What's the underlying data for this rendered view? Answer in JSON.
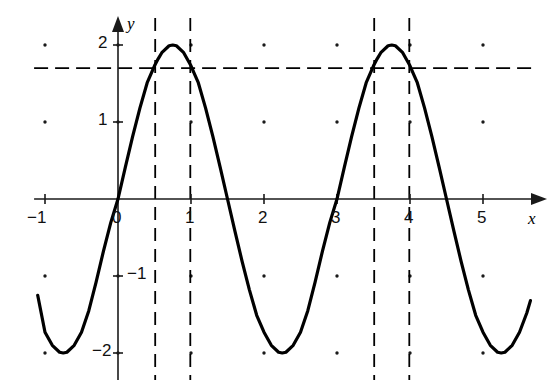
{
  "figure": {
    "background_color": "#ffffff",
    "curve_color": "#000000",
    "axis_color": "#1a1a1a",
    "dash_color": "#000000",
    "grid_dot_color": "#1a1a1a"
  },
  "axes": {
    "x_axis_label": "x",
    "y_axis_label": "y",
    "x_ticks": [
      {
        "value": -1,
        "label": "−1"
      },
      {
        "value": 0,
        "label": "0"
      },
      {
        "value": 1,
        "label": "1"
      },
      {
        "value": 2,
        "label": "2"
      },
      {
        "value": 3,
        "label": "3"
      },
      {
        "value": 4,
        "label": "4"
      },
      {
        "value": 5,
        "label": "5"
      }
    ],
    "y_ticks": [
      {
        "value": 2,
        "label": "2"
      },
      {
        "value": 1,
        "label": "1"
      },
      {
        "value": -1,
        "label": "−1"
      },
      {
        "value": -2,
        "label": "−2"
      }
    ]
  },
  "chart_data": {
    "type": "line",
    "title": "",
    "xlabel": "x",
    "ylabel": "y",
    "xlim": [
      -1.15,
      5.75
    ],
    "ylim": [
      -2.35,
      2.35
    ],
    "grid": "dots-at-integer-lattice",
    "legend": "none",
    "series": [
      {
        "name": "y = 2 sin(2πx/3)",
        "amplitude": 2,
        "period": 3,
        "phase": 0,
        "x_start": -1.1,
        "x_end": 5.65,
        "points": [
          [
            -1.1,
            -1.25
          ],
          [
            -1.0,
            -1.73
          ],
          [
            -0.9,
            -1.9
          ],
          [
            -0.8,
            -1.99
          ],
          [
            -0.75,
            -2.0
          ],
          [
            -0.7,
            -1.99
          ],
          [
            -0.6,
            -1.9
          ],
          [
            -0.5,
            -1.73
          ],
          [
            -0.4,
            -1.45
          ],
          [
            -0.3,
            -1.08
          ],
          [
            -0.2,
            -0.68
          ],
          [
            -0.1,
            -0.31
          ],
          [
            0.0,
            0.0
          ],
          [
            0.1,
            0.41
          ],
          [
            0.2,
            0.81
          ],
          [
            0.3,
            1.18
          ],
          [
            0.4,
            1.51
          ],
          [
            0.5,
            1.73
          ],
          [
            0.55,
            1.82
          ],
          [
            0.6,
            1.9
          ],
          [
            0.7,
            1.99
          ],
          [
            0.75,
            2.0
          ],
          [
            0.8,
            1.99
          ],
          [
            0.9,
            1.9
          ],
          [
            1.0,
            1.73
          ],
          [
            1.05,
            1.62
          ],
          [
            1.1,
            1.51
          ],
          [
            1.2,
            1.18
          ],
          [
            1.3,
            0.81
          ],
          [
            1.4,
            0.41
          ],
          [
            1.5,
            0.0
          ],
          [
            1.6,
            -0.41
          ],
          [
            1.7,
            -0.81
          ],
          [
            1.8,
            -1.18
          ],
          [
            1.9,
            -1.51
          ],
          [
            2.0,
            -1.73
          ],
          [
            2.1,
            -1.9
          ],
          [
            2.2,
            -1.99
          ],
          [
            2.25,
            -2.0
          ],
          [
            2.3,
            -1.99
          ],
          [
            2.4,
            -1.9
          ],
          [
            2.5,
            -1.73
          ],
          [
            2.6,
            -1.45
          ],
          [
            2.7,
            -1.08
          ],
          [
            2.8,
            -0.68
          ],
          [
            2.9,
            -0.31
          ],
          [
            3.0,
            0.0
          ],
          [
            3.1,
            0.41
          ],
          [
            3.2,
            0.81
          ],
          [
            3.3,
            1.18
          ],
          [
            3.4,
            1.51
          ],
          [
            3.5,
            1.73
          ],
          [
            3.55,
            1.82
          ],
          [
            3.6,
            1.9
          ],
          [
            3.7,
            1.99
          ],
          [
            3.75,
            2.0
          ],
          [
            3.8,
            1.99
          ],
          [
            3.9,
            1.9
          ],
          [
            4.0,
            1.73
          ],
          [
            4.05,
            1.62
          ],
          [
            4.1,
            1.51
          ],
          [
            4.2,
            1.18
          ],
          [
            4.3,
            0.81
          ],
          [
            4.4,
            0.41
          ],
          [
            4.5,
            0.0
          ],
          [
            4.6,
            -0.41
          ],
          [
            4.7,
            -0.81
          ],
          [
            4.8,
            -1.18
          ],
          [
            4.9,
            -1.51
          ],
          [
            5.0,
            -1.73
          ],
          [
            5.1,
            -1.9
          ],
          [
            5.2,
            -1.99
          ],
          [
            5.25,
            -2.0
          ],
          [
            5.3,
            -1.99
          ],
          [
            5.4,
            -1.9
          ],
          [
            5.5,
            -1.73
          ],
          [
            5.6,
            -1.48
          ],
          [
            5.65,
            -1.32
          ]
        ]
      }
    ],
    "horizontal_dashed_line": {
      "y": 1.7,
      "x_from": -1.15,
      "x_to": 5.75
    },
    "vertical_dashed_lines": [
      {
        "x": 0.51,
        "y_from": -2.35,
        "y_to": 2.35
      },
      {
        "x": 0.99,
        "y_from": -2.35,
        "y_to": 2.35
      },
      {
        "x": 3.51,
        "y_from": -2.35,
        "y_to": 2.35
      },
      {
        "x": 3.99,
        "y_from": -2.35,
        "y_to": 2.35
      }
    ],
    "grid_dot_x_values": [
      -1,
      0,
      1,
      2,
      3,
      4,
      5
    ],
    "grid_dot_y_values": [
      2,
      1,
      -1,
      -2
    ]
  }
}
